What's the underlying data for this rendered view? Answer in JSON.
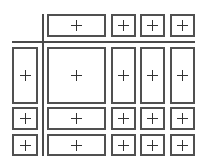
{
  "diagram": {
    "colors": {
      "border": "#505050",
      "divider": "#4a4a4a",
      "background": "#ffffff"
    },
    "columns": [
      {
        "x": 12,
        "w": 26
      },
      {
        "x": 47,
        "w": 59
      },
      {
        "x": 111,
        "w": 25
      },
      {
        "x": 140,
        "w": 25
      },
      {
        "x": 170,
        "w": 25
      }
    ],
    "rows": [
      {
        "y": 14,
        "h": 23
      },
      {
        "y": 47,
        "h": 57
      },
      {
        "y": 107,
        "h": 23
      },
      {
        "y": 134,
        "h": 22
      }
    ],
    "cells": [
      {
        "row": 0,
        "col": 1,
        "symbol": "+"
      },
      {
        "row": 0,
        "col": 2,
        "symbol": "+"
      },
      {
        "row": 0,
        "col": 3,
        "symbol": "+"
      },
      {
        "row": 0,
        "col": 4,
        "symbol": "+"
      },
      {
        "row": 1,
        "col": 0,
        "symbol": "+"
      },
      {
        "row": 1,
        "col": 1,
        "symbol": "+"
      },
      {
        "row": 1,
        "col": 2,
        "symbol": "+"
      },
      {
        "row": 1,
        "col": 3,
        "symbol": "+"
      },
      {
        "row": 1,
        "col": 4,
        "symbol": "+"
      },
      {
        "row": 2,
        "col": 0,
        "symbol": "+"
      },
      {
        "row": 2,
        "col": 1,
        "symbol": "+"
      },
      {
        "row": 2,
        "col": 2,
        "symbol": "+"
      },
      {
        "row": 2,
        "col": 3,
        "symbol": "+"
      },
      {
        "row": 2,
        "col": 4,
        "symbol": "+"
      },
      {
        "row": 3,
        "col": 0,
        "symbol": "+"
      },
      {
        "row": 3,
        "col": 1,
        "symbol": "+"
      },
      {
        "row": 3,
        "col": 2,
        "symbol": "+"
      },
      {
        "row": 3,
        "col": 3,
        "symbol": "+"
      },
      {
        "row": 3,
        "col": 4,
        "symbol": "+"
      }
    ],
    "dividers": {
      "vertical": {
        "x": 42,
        "y1": 14,
        "y2": 156
      },
      "horizontal": {
        "y": 41,
        "x1": 12,
        "x2": 195
      }
    }
  }
}
